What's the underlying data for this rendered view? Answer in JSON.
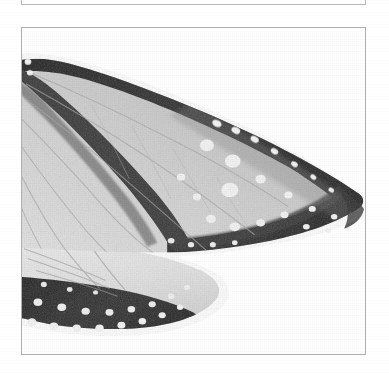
{
  "page": {
    "background_color": "#ffffff",
    "width": 389,
    "height": 373
  },
  "upper_figure_box": {
    "name": "upper-figure-box",
    "border_color": "#b9b9bd",
    "visible_portion": "bottom-edge-only",
    "caption": "",
    "label": ""
  },
  "figure": {
    "name": "butterfly-wing-plate",
    "border_color": "#b0b0b4",
    "background_color": "#ffffff",
    "caption": "",
    "label": "",
    "rendering": "grayscale-halftone-scan"
  },
  "specimen": {
    "name": "butterfly-wing-specimen",
    "type": "danaid-butterfly-wing",
    "orientation": "apex-to-the-right",
    "tones": {
      "membrane_light": "#d2d2d2",
      "membrane_mid": "#bfbfbf",
      "membrane_pale": "#e6e6e6",
      "vein_dark": "#3a3a3a",
      "margin_dark": "#2b2b2b",
      "spot_white": "#f7f7f7",
      "background": "#ffffff"
    },
    "features": {
      "forewing_spot_rows": 2,
      "hindwing_spot_rows": 2,
      "discal_band": "dark-diagonal-vein-band",
      "apex_spots": "white-subapical-spots"
    }
  },
  "icons": {
    "none": ""
  }
}
